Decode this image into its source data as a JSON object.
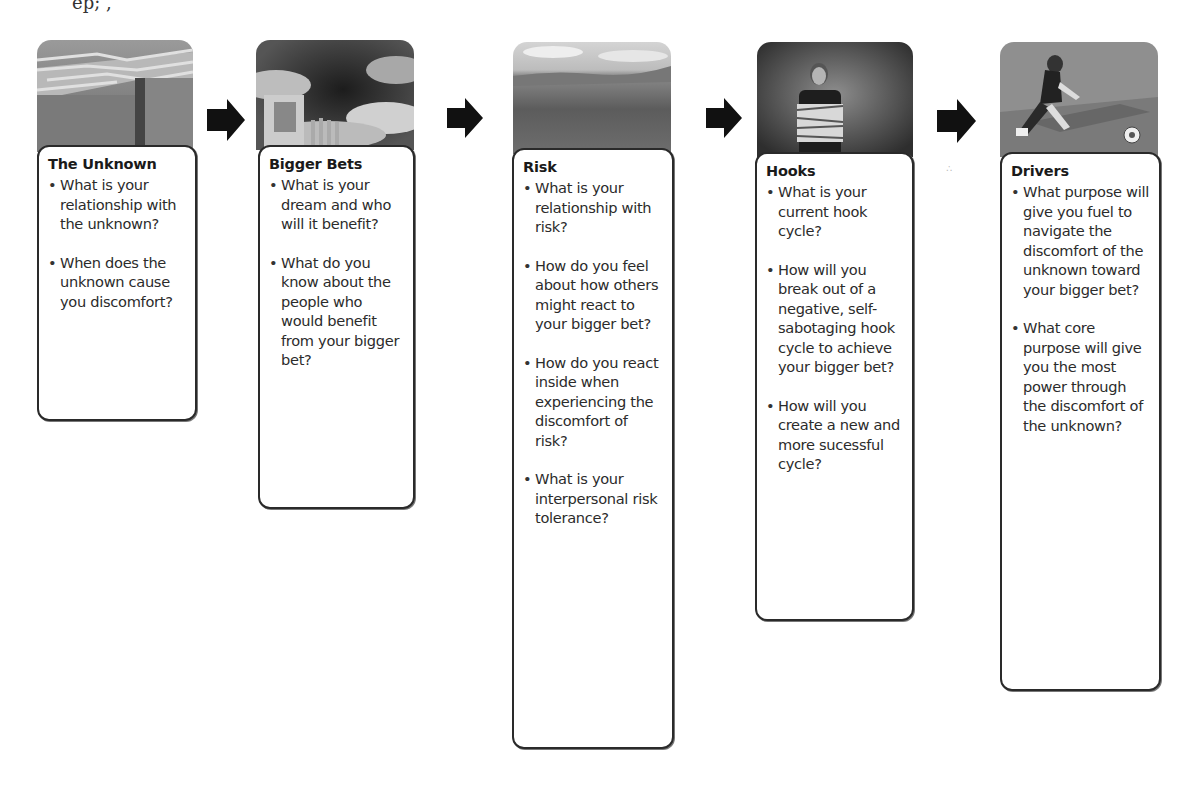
{
  "stages": [
    {
      "title": "The Unknown",
      "image_icon": "maze-photo",
      "questions": [
        "What is your relationship with the unknown?",
        "When does the unknown cause you discomfort?"
      ]
    },
    {
      "title": "Bigger Bets",
      "image_icon": "door-in-clouds-photo",
      "questions": [
        "What is your dream and who will it benefit?",
        "What do you know about the people who would benefit from your bigger bet?"
      ]
    },
    {
      "title": "Risk",
      "image_icon": "landscape-photo",
      "questions": [
        "What is your relationship with risk?",
        "How do you feel about how others might react to your bigger bet?",
        "How do you react inside when experiencing the discomfort of risk?",
        "What is your interpersonal risk tolerance?"
      ]
    },
    {
      "title": "Hooks",
      "image_icon": "taped-man-photo",
      "questions": [
        "What is your current hook cycle?",
        "How will you break out of a negative, self-sabotaging hook cycle to achieve your bigger bet?",
        "How will you create a new and more sucessful cycle?"
      ]
    },
    {
      "title": "Drivers",
      "image_icon": "soccer-player-photo",
      "questions": [
        "What purpose will give you fuel to navigate the discomfort of the unknown toward your bigger bet?",
        "What core purpose will give you the most power through the discomfort of the unknown?"
      ]
    }
  ],
  "arrows": [
    "arrow-right-icon",
    "arrow-right-icon",
    "arrow-right-icon",
    "arrow-right-icon"
  ],
  "top_artifact": "ep; ,"
}
